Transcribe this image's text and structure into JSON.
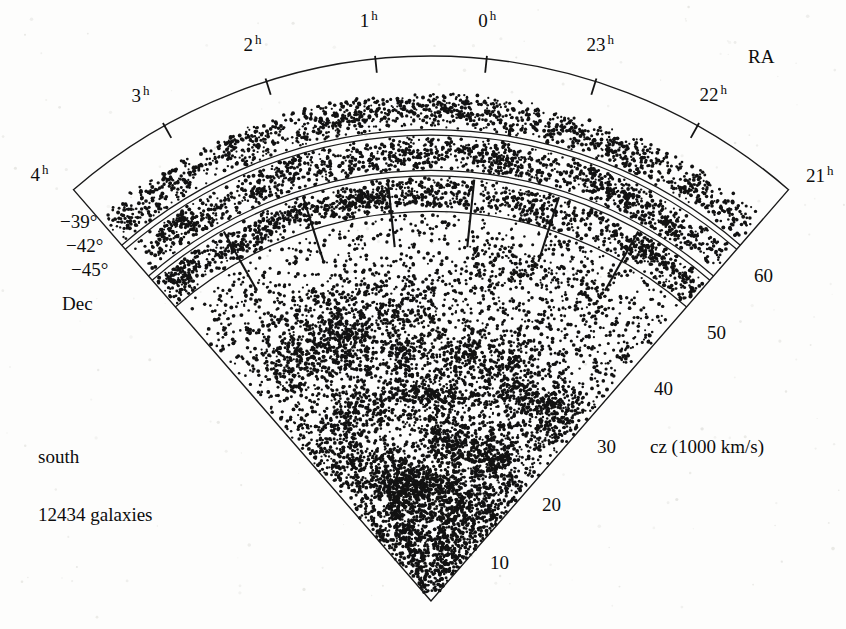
{
  "figure": {
    "type": "wedge-cone-diagram",
    "survey_note": "south",
    "galaxy_count_label": "12434 galaxies"
  },
  "axes": {
    "ra_axis_title": "RA",
    "dec_axis_title": "Dec",
    "cz_axis_title": "cz (1000 km/s)"
  },
  "ra_ticks": [
    {
      "label": "4",
      "sup": "h",
      "hours": 4
    },
    {
      "label": "3",
      "sup": "h",
      "hours": 3
    },
    {
      "label": "2",
      "sup": "h",
      "hours": 2
    },
    {
      "label": "1",
      "sup": "h",
      "hours": 1
    },
    {
      "label": "0",
      "sup": "h",
      "hours": 0
    },
    {
      "label": "23",
      "sup": "h",
      "hours": 23
    },
    {
      "label": "22",
      "sup": "h",
      "hours": 22
    },
    {
      "label": "21",
      "sup": "h",
      "hours": 21
    }
  ],
  "dec_ticks": [
    {
      "label": "−39°",
      "value": -39
    },
    {
      "label": "−42°",
      "value": -42
    },
    {
      "label": "−45°",
      "value": -45
    }
  ],
  "cz_ticks": [
    {
      "label": "10",
      "value": 10
    },
    {
      "label": "20",
      "value": 20
    },
    {
      "label": "30",
      "value": 30
    },
    {
      "label": "40",
      "value": 40
    },
    {
      "label": "50",
      "value": 50
    },
    {
      "label": "60",
      "value": 60
    }
  ],
  "chart_data": {
    "type": "scatter",
    "title": "",
    "subtitle": "",
    "projection": "polar-wedge",
    "xlabel": "RA",
    "ylabel": "cz (1000 km/s)",
    "radial_axis": {
      "name": "cz",
      "unit": "1000 km/s",
      "range": [
        0,
        65
      ],
      "ticks": [
        10,
        20,
        30,
        40,
        50,
        60
      ],
      "tick_labels": [
        "10",
        "20",
        "30",
        "40",
        "50",
        "60"
      ]
    },
    "angular_axis": {
      "name": "RA",
      "unit": "hours",
      "range_hours": [
        21,
        4
      ],
      "ticks_hours": [
        4,
        3,
        2,
        1,
        0,
        23,
        22,
        21
      ],
      "tick_labels": [
        "4 h",
        "3 h",
        "2 h",
        "1 h",
        "0 h",
        "23 h",
        "22 h",
        "21 h"
      ]
    },
    "third_axis": {
      "name": "Dec",
      "unit": "degrees",
      "ticks": [
        -39,
        -42,
        -45
      ],
      "tick_labels": [
        "−39°",
        "−42°",
        "−45°"
      ]
    },
    "n_points": 12434,
    "legend": [],
    "grid": false,
    "annotations": [
      "south",
      "12434 galaxies",
      "RA",
      "Dec",
      "cz (1000 km/s)"
    ],
    "slices": [
      {
        "name": "dec strip 1",
        "dec_range": [
          -39,
          -42
        ],
        "radius_frac": [
          0.865,
          0.935
        ]
      },
      {
        "name": "dec strip 2",
        "dec_range": [
          -42,
          -45
        ],
        "radius_frac": [
          0.79,
          0.855
        ]
      },
      {
        "name": "dec strip 3",
        "dec_range": [
          -45,
          -48
        ],
        "radius_frac": [
          0.715,
          0.78
        ]
      }
    ]
  }
}
